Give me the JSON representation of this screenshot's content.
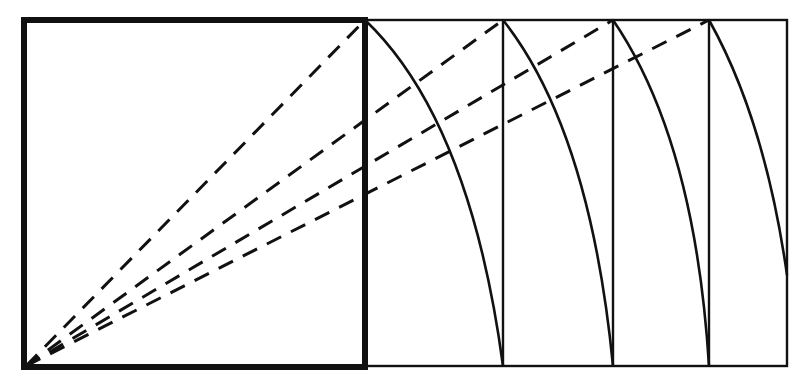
{
  "diagram": {
    "colors": {
      "stroke": "#111111",
      "background": "#ffffff"
    },
    "square": {
      "x": 24,
      "y": 20,
      "w": 341,
      "h": 348
    },
    "outer_rect": {
      "x": 24,
      "y": 20,
      "w": 763,
      "h": 348
    },
    "vertical_lines": [
      503,
      613,
      709
    ],
    "origin": {
      "x": 26,
      "y": 366
    },
    "dashed_targets": [
      {
        "x": 365,
        "y": 20
      },
      {
        "x": 503,
        "y": 20
      },
      {
        "x": 613,
        "y": 20
      },
      {
        "x": 709,
        "y": 20
      }
    ],
    "arcs": [
      {
        "from": [
          365,
          20
        ],
        "to": [
          503,
          366
        ]
      },
      {
        "from": [
          503,
          20
        ],
        "to": [
          613,
          366
        ]
      },
      {
        "from": [
          613,
          20
        ],
        "to": [
          709,
          366
        ]
      },
      {
        "from": [
          709,
          20
        ],
        "to": [
          787,
          275
        ]
      }
    ]
  }
}
